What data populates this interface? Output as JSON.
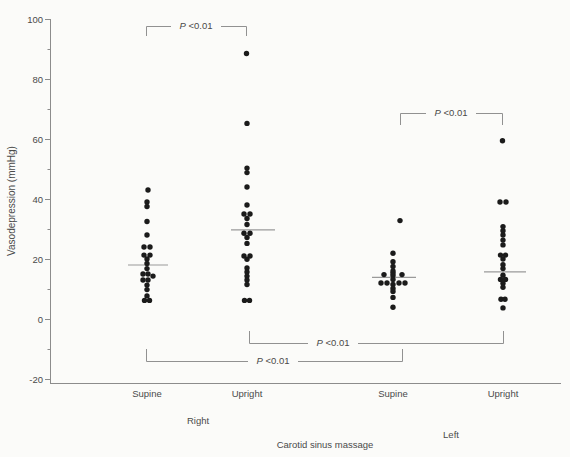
{
  "figure": {
    "ylabel": "Vasodepression (mmHg)",
    "xlabel": "Carotid sinus massage"
  },
  "chart_data": {
    "type": "scatter",
    "title": "",
    "ylabel": "Vasodepression (mmHg)",
    "xlabel": "Carotid sinus massage",
    "ylim": [
      -20,
      100
    ],
    "y_major_ticks": [
      100,
      80,
      60,
      40,
      20,
      0,
      -20
    ],
    "y_minor_ticks": [
      90,
      70,
      50,
      30,
      10,
      -10
    ],
    "grid": false,
    "legend": "none",
    "colors": {
      "dot": "#1b1b1b",
      "axis": "#8c8c8c",
      "mean_line": "#9a9a9a",
      "bracket": "#919191",
      "text": "#4a4a4a",
      "background": "#fbfbf9"
    },
    "groups": [
      {
        "label": "Supine",
        "side": "Right",
        "x": 147,
        "label_y": 397,
        "mean": 18,
        "mean_line_x": [
          128,
          168
        ],
        "points": [
          {
            "v": 43,
            "dx": 1
          },
          {
            "v": 39,
            "dx": 0
          },
          {
            "v": 37.5,
            "dx": 0
          },
          {
            "v": 32.5,
            "dx": 0
          },
          {
            "v": 28,
            "dx": 0
          },
          {
            "v": 24,
            "dx": -3
          },
          {
            "v": 24,
            "dx": 3
          },
          {
            "v": 21.3,
            "dx": -3
          },
          {
            "v": 21.3,
            "dx": 3
          },
          {
            "v": 20,
            "dx": 0
          },
          {
            "v": 18.5,
            "dx": 0
          },
          {
            "v": 16.8,
            "dx": 0
          },
          {
            "v": 15,
            "dx": -4
          },
          {
            "v": 15,
            "dx": 1
          },
          {
            "v": 14.3,
            "dx": 6
          },
          {
            "v": 13,
            "dx": -4
          },
          {
            "v": 13,
            "dx": 1
          },
          {
            "v": 11.3,
            "dx": 0
          },
          {
            "v": 9.8,
            "dx": 0
          },
          {
            "v": 7.7,
            "dx": 0
          },
          {
            "v": 6.2,
            "dx": -2.5
          },
          {
            "v": 6.2,
            "dx": 2.5
          }
        ]
      },
      {
        "label": "Upright",
        "side": "Right",
        "x": 247,
        "label_y": 397,
        "mean": 29.7,
        "mean_line_x": [
          231,
          275
        ],
        "points": [
          {
            "v": 88.5,
            "dx": -0.5
          },
          {
            "v": 65.2,
            "dx": 0
          },
          {
            "v": 50.3,
            "dx": 0
          },
          {
            "v": 48.8,
            "dx": 0
          },
          {
            "v": 44,
            "dx": 0
          },
          {
            "v": 38,
            "dx": 0
          },
          {
            "v": 35,
            "dx": -3
          },
          {
            "v": 35,
            "dx": 3
          },
          {
            "v": 33.5,
            "dx": 0
          },
          {
            "v": 31.5,
            "dx": 0
          },
          {
            "v": 28.6,
            "dx": -3
          },
          {
            "v": 28.6,
            "dx": 3
          },
          {
            "v": 27.2,
            "dx": 0
          },
          {
            "v": 25.2,
            "dx": 0
          },
          {
            "v": 21,
            "dx": -3
          },
          {
            "v": 21,
            "dx": 3
          },
          {
            "v": 19.9,
            "dx": 0
          },
          {
            "v": 17,
            "dx": 0
          },
          {
            "v": 15.7,
            "dx": 0
          },
          {
            "v": 14.3,
            "dx": 0
          },
          {
            "v": 13,
            "dx": 0
          },
          {
            "v": 11.5,
            "dx": 0
          },
          {
            "v": 6.2,
            "dx": -2.5
          },
          {
            "v": 6.2,
            "dx": 2.5
          }
        ]
      },
      {
        "label": "Supine",
        "side": "Left",
        "x": 393,
        "label_y": 397,
        "mean": 13.9,
        "mean_line_x": [
          372,
          416
        ],
        "points": [
          {
            "v": 32.8,
            "dx": 7
          },
          {
            "v": 21.9,
            "dx": 0
          },
          {
            "v": 19.1,
            "dx": 0
          },
          {
            "v": 17.5,
            "dx": 0
          },
          {
            "v": 16,
            "dx": 0
          },
          {
            "v": 15.3,
            "dx": 0
          },
          {
            "v": 14.8,
            "dx": -9
          },
          {
            "v": 14.8,
            "dx": 9
          },
          {
            "v": 14.5,
            "dx": 0
          },
          {
            "v": 13.2,
            "dx": 0
          },
          {
            "v": 12,
            "dx": -12
          },
          {
            "v": 12,
            "dx": -6
          },
          {
            "v": 12,
            "dx": 6
          },
          {
            "v": 12,
            "dx": 12
          },
          {
            "v": 11.5,
            "dx": 0
          },
          {
            "v": 10.2,
            "dx": 0
          },
          {
            "v": 9.2,
            "dx": 0
          },
          {
            "v": 7.2,
            "dx": 0
          },
          {
            "v": 3.9,
            "dx": 0
          }
        ]
      },
      {
        "label": "Upright",
        "side": "Left",
        "x": 503,
        "label_y": 397,
        "mean": 15.7,
        "mean_line_x": [
          484,
          526
        ],
        "points": [
          {
            "v": 59.4,
            "dx": -0.5
          },
          {
            "v": 39,
            "dx": -3
          },
          {
            "v": 39,
            "dx": 3
          },
          {
            "v": 30.8,
            "dx": 0
          },
          {
            "v": 29.4,
            "dx": 0
          },
          {
            "v": 28,
            "dx": 0
          },
          {
            "v": 26.3,
            "dx": 0
          },
          {
            "v": 24.7,
            "dx": 0
          },
          {
            "v": 21.3,
            "dx": -2.5
          },
          {
            "v": 21.3,
            "dx": 2.5
          },
          {
            "v": 20,
            "dx": 0
          },
          {
            "v": 18.1,
            "dx": 0
          },
          {
            "v": 16.8,
            "dx": 0
          },
          {
            "v": 14.6,
            "dx": 0
          },
          {
            "v": 13.2,
            "dx": -2.5
          },
          {
            "v": 13.2,
            "dx": 2.5
          },
          {
            "v": 11.9,
            "dx": 0
          },
          {
            "v": 10.6,
            "dx": 0
          },
          {
            "v": 6.6,
            "dx": -2
          },
          {
            "v": 6.6,
            "dx": 2
          },
          {
            "v": 3.7,
            "dx": 0
          }
        ]
      }
    ],
    "side_labels": [
      {
        "text": "Right",
        "x": 198,
        "y": 424
      },
      {
        "text": "Left",
        "x": 451,
        "y": 438
      }
    ],
    "xlabel_pos": {
      "x": 325,
      "y": 448
    },
    "brackets": [
      {
        "x1": 146,
        "x2": 246,
        "y": 26,
        "tick": "down",
        "tick_len": 10,
        "label": "P <0.01",
        "lx": 196
      },
      {
        "x1": 400,
        "x2": 502,
        "y": 113,
        "tick": "down",
        "tick_len": 12,
        "label": "P <0.01",
        "lx": 451
      },
      {
        "x1": 249,
        "x2": 503,
        "y": 343,
        "tick": "up",
        "tick_len": 12,
        "label": "P <0.01",
        "lx": 333
      },
      {
        "x1": 146,
        "x2": 402,
        "y": 361,
        "tick": "up",
        "tick_len": 12,
        "label": "P <0.01",
        "lx": 273
      }
    ]
  }
}
